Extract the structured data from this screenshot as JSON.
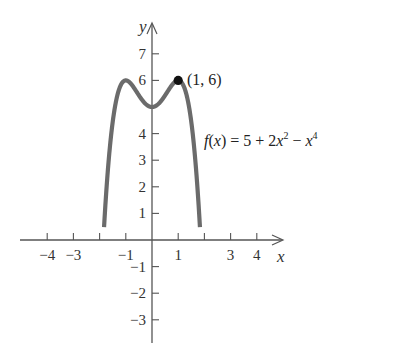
{
  "chart_data": {
    "type": "line",
    "title": "",
    "function": "f(x) = 5 + 2x^2 - x^4",
    "xlabel": "x",
    "ylabel": "y",
    "xlim": [
      -4.6,
      4.9
    ],
    "ylim": [
      -3.8,
      7.8
    ],
    "grid": false,
    "legend": null,
    "x_ticks": [
      -4,
      -3,
      -2,
      -1,
      1,
      2,
      3,
      4
    ],
    "x_tick_labels": [
      "−4",
      "−3",
      "",
      "−1",
      "1",
      "",
      "3",
      "4"
    ],
    "y_ticks": [
      -3,
      -2,
      -1,
      1,
      2,
      3,
      4,
      6,
      7
    ],
    "y_tick_labels": [
      "−3",
      "−2",
      "−1",
      "1",
      "2",
      "3",
      "4",
      "6",
      "7"
    ],
    "series": [
      {
        "name": "f(x) = 5 + 2x^2 - x^4",
        "x": [
          -1.85,
          -1.7,
          -1.5,
          -1.25,
          -1.0,
          -0.75,
          -0.5,
          -0.25,
          0,
          0.25,
          0.5,
          0.75,
          1.0,
          1.25,
          1.5,
          1.7,
          1.85
        ],
        "values": [
          -1.87,
          2.43,
          4.44,
          5.68,
          6.0,
          5.81,
          5.44,
          5.12,
          5.0,
          5.12,
          5.44,
          5.81,
          6.0,
          5.68,
          4.44,
          2.43,
          -1.87
        ],
        "color": "#6b6b6b"
      }
    ],
    "points": [
      {
        "x": 1,
        "y": 6,
        "label": "(1, 6)"
      }
    ],
    "annotations": [
      {
        "text": "(1, 6)",
        "x": 1.15,
        "y": 6.2
      },
      {
        "text": "f(x) = 5 + 2x² − x⁴",
        "x": 2.0,
        "y": 3.5
      }
    ]
  },
  "labels": {
    "y_axis": "y",
    "x_axis": "x",
    "point": "(1, 6)",
    "formula_f": "f",
    "formula_paren_open": "(",
    "formula_x": "x",
    "formula_rest": ") = 5 + 2",
    "formula_x2": "x",
    "formula_sup2": "2",
    "formula_minus": " − ",
    "formula_x4": "x",
    "formula_sup4": "4"
  },
  "colors": {
    "curve": "#6b6b6b",
    "axis": "#555555",
    "point": "#111111",
    "text": "#333333"
  }
}
